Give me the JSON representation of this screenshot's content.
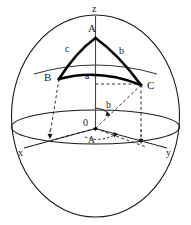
{
  "figure": {
    "type": "geometry-diagram",
    "background_color": "#ffffff",
    "stroke_color": "#1a1a1a",
    "thick_stroke_color": "#000000",
    "labels": {
      "axis_z": "z",
      "axis_x": "x",
      "axis_y": "y",
      "origin": "0",
      "vertex_a": "A",
      "vertex_b": "B",
      "vertex_c": "C",
      "side_a": "a",
      "side_b": "b",
      "side_c": "c",
      "angle_b": "b",
      "angle_a": "A"
    }
  }
}
